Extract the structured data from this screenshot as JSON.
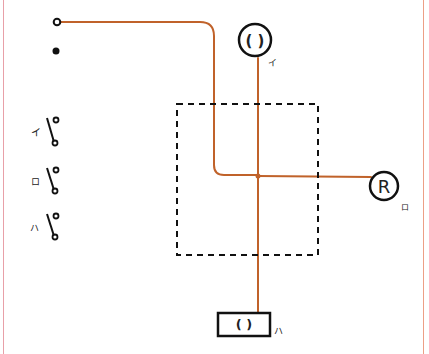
{
  "diagram": {
    "title": "",
    "colors": {
      "wire": "#c0622a",
      "ink": "#111111",
      "frame_left": "#e8a0a8",
      "frame_right": "#ec9f86"
    },
    "terminals": [
      {
        "id": "open-terminal",
        "style": "hollow"
      },
      {
        "id": "filled-terminal",
        "style": "filled"
      }
    ],
    "switches": [
      {
        "label": "イ",
        "id": "switch-i"
      },
      {
        "label": "ロ",
        "id": "switch-ro"
      },
      {
        "label": "ハ",
        "id": "switch-ha"
      }
    ],
    "fixtures": [
      {
        "id": "ceiling-light",
        "symbol": "( )",
        "label": "イ"
      },
      {
        "id": "receptacle-light",
        "symbol": "R",
        "label": "ロ"
      },
      {
        "id": "wall-light",
        "symbol": "( )",
        "label": "ハ"
      }
    ],
    "junction_box": {
      "style": "dashed"
    }
  }
}
